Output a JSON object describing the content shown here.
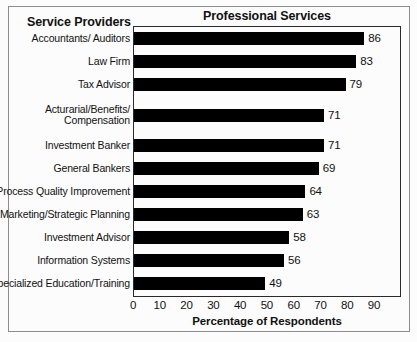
{
  "headers": {
    "left_header": "Service Providers",
    "title": "Professional Services"
  },
  "chart_data": {
    "type": "bar",
    "orientation": "horizontal",
    "title": "Professional Services",
    "xlabel": "Percentage of Respondents",
    "ylabel": "Service Providers",
    "xlim": [
      0,
      90
    ],
    "xticks": [
      0,
      10,
      20,
      30,
      40,
      50,
      60,
      70,
      80,
      90
    ],
    "grid": false,
    "legend": null,
    "bar_color": "#000000",
    "categories": [
      "Accountants/ Auditors",
      "Law Firm",
      "Tax Advisor",
      "Acturarial/Benefits/\nCompensation",
      "Investment Banker",
      "General Bankers",
      "Process Quality Improvement",
      "Marketing/Strategic Planning",
      "Investment Advisor",
      "Information Systems",
      "Specialized Education/Training"
    ],
    "values": [
      86,
      83,
      79,
      71,
      71,
      69,
      64,
      63,
      58,
      56,
      49
    ]
  }
}
